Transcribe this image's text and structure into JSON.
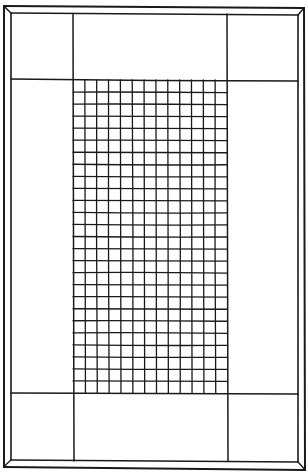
{
  "drawing": {
    "title": "Hand-drawn rug / frame with central grid",
    "ink_color": "#1a1a1a",
    "background_color": "#ffffff",
    "outer_frame": {
      "x0": 4,
      "y0": 6,
      "x1": 304,
      "y1": 470
    },
    "inner_frame": {
      "x0": 11,
      "y0": 13,
      "x1": 298,
      "y1": 462
    },
    "divider_lines": {
      "vertical_left_x": 73,
      "vertical_right_x": 227,
      "horizontal_top_y": 80,
      "horizontal_bottom_y": 393
    },
    "grid": {
      "x0": 73,
      "y0": 80,
      "x1": 227,
      "y1": 393,
      "columns": 13,
      "rows": 26
    }
  }
}
